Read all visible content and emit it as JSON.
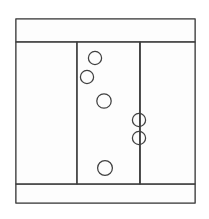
{
  "figure": {
    "title": "",
    "canvas": {
      "width": 209,
      "height": 219,
      "background": "#ffffff"
    },
    "line_color": "#3b3b3b",
    "fill_color": "#fefefe",
    "circle_stroke_color": "#404040"
  },
  "frame": {
    "label": "outer-frame",
    "x": 16,
    "y": 19,
    "width": 179,
    "height": 184
  },
  "bands": [
    {
      "name": "top-band",
      "label": "",
      "y_top": 19,
      "y_bottom": 42
    },
    {
      "name": "bottom-band",
      "label": "",
      "y_top": 184,
      "y_bottom": 203
    }
  ],
  "columns": [
    {
      "name": "left-column",
      "label": "",
      "x_left": 16,
      "x_right": 77
    },
    {
      "name": "center-column",
      "label": "",
      "x_left": 77,
      "x_right": 140
    },
    {
      "name": "right-column",
      "label": "",
      "x_left": 140,
      "x_right": 195
    }
  ],
  "dividers": [
    {
      "name": "vertical-divider-left",
      "orientation": "vertical",
      "x": 77,
      "y1": 42,
      "y2": 184
    },
    {
      "name": "vertical-divider-right",
      "orientation": "vertical",
      "x": 140,
      "y1": 42,
      "y2": 184
    },
    {
      "name": "horizontal-divider-top",
      "orientation": "horizontal",
      "y": 42,
      "x1": 16,
      "x2": 195
    },
    {
      "name": "horizontal-divider-bottom",
      "orientation": "horizontal",
      "y": 184,
      "x1": 16,
      "x2": 195
    }
  ],
  "circles": [
    {
      "id": 1,
      "label": "",
      "cx": 95,
      "cy": 58,
      "r": 6.6,
      "region": "center-column",
      "clipped": false
    },
    {
      "id": 2,
      "label": "",
      "cx": 87,
      "cy": 77,
      "r": 6.6,
      "region": "center-column",
      "clipped": false
    },
    {
      "id": 3,
      "label": "",
      "cx": 104,
      "cy": 101,
      "r": 7.2,
      "region": "center-column",
      "clipped": false
    },
    {
      "id": 4,
      "label": "",
      "cx": 139,
      "cy": 120,
      "r": 6.6,
      "region": "center-column",
      "clipped": true
    },
    {
      "id": 5,
      "label": "",
      "cx": 139,
      "cy": 138,
      "r": 6.6,
      "region": "center-column",
      "clipped": true
    },
    {
      "id": 6,
      "label": "",
      "cx": 105,
      "cy": 168,
      "r": 7.4,
      "region": "center-column",
      "clipped": false
    }
  ],
  "circle_count": 6,
  "annotations": []
}
